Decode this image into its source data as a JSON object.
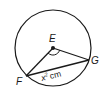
{
  "diagram": {
    "type": "circle-geometry",
    "center": {
      "label": "E",
      "x": 53,
      "y": 48
    },
    "radius": 38,
    "points": [
      {
        "label": "E",
        "x": 53,
        "y": 48,
        "role": "center"
      },
      {
        "label": "F",
        "x": 26,
        "y": 76,
        "role": "on-circle"
      },
      {
        "label": "G",
        "x": 89,
        "y": 60,
        "role": "on-circle"
      }
    ],
    "segments": [
      {
        "from": "E",
        "to": "F",
        "kind": "radius"
      },
      {
        "from": "E",
        "to": "G",
        "kind": "radius"
      },
      {
        "from": "F",
        "to": "G",
        "kind": "chord",
        "label": "x² cm"
      }
    ],
    "angle_mark": {
      "vertex": "E",
      "between": [
        "F",
        "G"
      ]
    },
    "labels": {
      "E": "E",
      "F": "F",
      "G": "G",
      "chord_var": "x",
      "chord_exp": "2",
      "chord_unit": "cm"
    },
    "colors": {
      "stroke": "#1a1a1a",
      "background": "#ffffff"
    }
  }
}
